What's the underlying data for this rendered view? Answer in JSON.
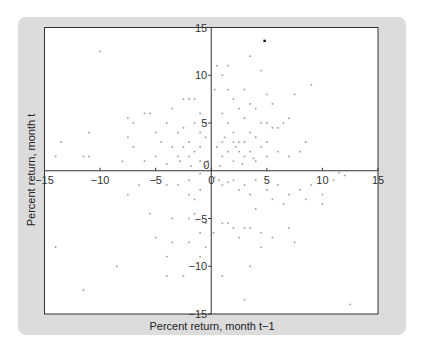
{
  "chart_data": {
    "type": "scatter",
    "title": "",
    "xlabel": "Percent return, month t−1",
    "ylabel": "Percent return, month t",
    "xlim": [
      -15,
      15
    ],
    "ylim": [
      -15,
      15
    ],
    "xticks": [
      -15,
      -10,
      -5,
      0,
      5,
      10,
      15
    ],
    "yticks": [
      -15,
      -10,
      -5,
      0,
      5,
      10,
      15
    ],
    "xtick_labels": [
      "−15",
      "−10",
      "−5",
      "0",
      "5",
      "10",
      "15"
    ],
    "ytick_labels": [
      "−15",
      "−10",
      "−5",
      "0",
      "5",
      "10",
      "15"
    ],
    "grid": false,
    "axes_through_origin": true,
    "colors": {
      "frame": "#dcdcdc",
      "plot_bg": "#ffffff",
      "points": "#9a9a9a",
      "highlight": "#111111",
      "axis": "#333333"
    },
    "highlight_point": {
      "x": 4.8,
      "y": 13.6
    },
    "series": [
      {
        "name": "monthly returns",
        "points": [
          [
            -10,
            12.5
          ],
          [
            -13.5,
            3
          ],
          [
            -14,
            1.5
          ],
          [
            -11.5,
            1.5
          ],
          [
            -11,
            1.5
          ],
          [
            -11,
            4
          ],
          [
            -7.5,
            5.5
          ],
          [
            -7,
            5
          ],
          [
            -7.5,
            3.5
          ],
          [
            -7,
            2.5
          ],
          [
            -6,
            6
          ],
          [
            -5.5,
            6
          ],
          [
            -5,
            4
          ],
          [
            -4.5,
            3
          ],
          [
            -4,
            5
          ],
          [
            -3.5,
            6.5
          ],
          [
            -3.5,
            2.5
          ],
          [
            -3,
            4
          ],
          [
            -3,
            1.5
          ],
          [
            -2.5,
            7.5
          ],
          [
            -2.5,
            4.5
          ],
          [
            -2.5,
            2.5
          ],
          [
            -2,
            7.5
          ],
          [
            -2,
            3
          ],
          [
            -2,
            1.5
          ],
          [
            -1.5,
            7.5
          ],
          [
            -1.5,
            5
          ],
          [
            -1.5,
            2
          ],
          [
            -1,
            6
          ],
          [
            -1,
            4
          ],
          [
            -1,
            2.5
          ],
          [
            -1,
            1
          ],
          [
            -0.5,
            5
          ],
          [
            -0.5,
            3.5
          ],
          [
            -0.5,
            0.5
          ],
          [
            -0.3,
            1
          ],
          [
            -4,
            0.7
          ],
          [
            -5,
            1.5
          ],
          [
            -6,
            1
          ],
          [
            -8,
            1
          ],
          [
            -2.8,
            1
          ],
          [
            -1.8,
            0.5
          ],
          [
            0.3,
            8.5
          ],
          [
            0.5,
            11
          ],
          [
            1,
            10
          ],
          [
            1,
            6
          ],
          [
            1,
            3
          ],
          [
            1,
            1.5
          ],
          [
            1.5,
            11
          ],
          [
            1.5,
            8.5
          ],
          [
            1.5,
            5
          ],
          [
            1.5,
            2
          ],
          [
            2,
            7.5
          ],
          [
            2,
            4
          ],
          [
            2,
            3
          ],
          [
            2,
            1
          ],
          [
            2.5,
            6.5
          ],
          [
            2.5,
            3
          ],
          [
            2.5,
            2
          ],
          [
            3,
            8.5
          ],
          [
            3,
            5.5
          ],
          [
            3,
            3
          ],
          [
            3,
            1.5
          ],
          [
            3.5,
            12
          ],
          [
            3.5,
            7
          ],
          [
            3.5,
            4
          ],
          [
            3.5,
            2
          ],
          [
            4,
            6.5
          ],
          [
            4,
            3.5
          ],
          [
            4,
            1
          ],
          [
            4.5,
            10.5
          ],
          [
            4.5,
            5
          ],
          [
            4.5,
            2.5
          ],
          [
            5,
            8
          ],
          [
            5,
            5
          ],
          [
            5,
            3
          ],
          [
            5,
            1.5
          ],
          [
            5.5,
            7
          ],
          [
            5.5,
            4.5
          ],
          [
            6,
            4.5
          ],
          [
            6,
            2
          ],
          [
            6.5,
            5
          ],
          [
            7,
            5.5
          ],
          [
            7.5,
            8
          ],
          [
            7,
            1.5
          ],
          [
            8,
            2
          ],
          [
            8.5,
            3
          ],
          [
            9,
            9
          ],
          [
            0.5,
            2.5
          ],
          [
            1.2,
            3.5
          ],
          [
            2.2,
            2.5
          ],
          [
            2.8,
            0.7
          ],
          [
            3.8,
            1.3
          ],
          [
            0.8,
            0.5
          ],
          [
            -1,
            -0.3
          ],
          [
            -2,
            -1
          ],
          [
            -3,
            -1.5
          ],
          [
            -4,
            -1.5
          ],
          [
            -5,
            -1
          ],
          [
            -6.5,
            -1.5
          ],
          [
            -7.5,
            -2.5
          ],
          [
            -1.5,
            -3
          ],
          [
            -2,
            -2.5
          ],
          [
            -1,
            -2
          ],
          [
            -5.5,
            -4.5
          ],
          [
            -3.5,
            -5
          ],
          [
            -2,
            -5
          ],
          [
            -1.5,
            -4.5
          ],
          [
            -1,
            -6.5
          ],
          [
            -0.5,
            -5.5
          ],
          [
            -3.5,
            -7.5
          ],
          [
            -2,
            -7.5
          ],
          [
            -0.5,
            -8
          ],
          [
            -5,
            -7
          ],
          [
            -4,
            -9
          ],
          [
            -1,
            -9
          ],
          [
            -4,
            -11
          ],
          [
            -2.5,
            -11
          ],
          [
            -8.5,
            -10
          ],
          [
            -14,
            -8
          ],
          [
            -11.5,
            -12.5
          ],
          [
            0.3,
            -0.7
          ],
          [
            0.7,
            -1
          ],
          [
            1,
            -1.5
          ],
          [
            1.5,
            -1.2
          ],
          [
            2,
            -1
          ],
          [
            2.5,
            -2
          ],
          [
            3,
            -1.5
          ],
          [
            3.5,
            -2.5
          ],
          [
            4,
            -1
          ],
          [
            5,
            -2
          ],
          [
            5.5,
            -3
          ],
          [
            6,
            -1.5
          ],
          [
            6.5,
            -3.5
          ],
          [
            7,
            -2.5
          ],
          [
            8,
            -2
          ],
          [
            8.5,
            -3
          ],
          [
            9,
            -1.5
          ],
          [
            10,
            -2.5
          ],
          [
            10,
            -3.5
          ],
          [
            11,
            -1
          ],
          [
            12,
            -0.5
          ],
          [
            11.5,
            -0.2
          ],
          [
            1,
            -5.5
          ],
          [
            1.5,
            -5.5
          ],
          [
            2,
            -6
          ],
          [
            2.5,
            -7
          ],
          [
            3,
            -6
          ],
          [
            3.5,
            -6
          ],
          [
            4,
            -4
          ],
          [
            4.5,
            -6.5
          ],
          [
            5.5,
            -7
          ],
          [
            0.2,
            -6.5
          ],
          [
            1,
            -11
          ],
          [
            3.5,
            -10
          ],
          [
            4.5,
            -8
          ],
          [
            7,
            -6
          ],
          [
            7.5,
            -7.5
          ],
          [
            3,
            -13.5
          ],
          [
            12.5,
            -14
          ]
        ]
      }
    ]
  }
}
